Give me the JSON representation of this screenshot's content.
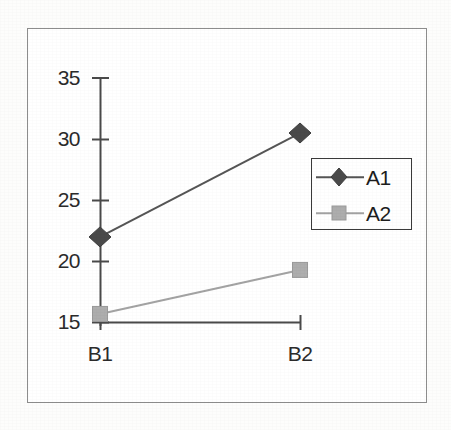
{
  "chart_data": {
    "type": "line",
    "title": "",
    "subtitle": "",
    "xlabel": "",
    "ylabel": "",
    "categories": [
      "B1",
      "B2"
    ],
    "series": [
      {
        "name": "A1",
        "values": [
          22.0,
          30.5
        ],
        "marker": "diamond",
        "color": "#4a4a4a"
      },
      {
        "name": "A2",
        "values": [
          15.7,
          19.3
        ],
        "marker": "square",
        "color": "#a3a3a3"
      }
    ],
    "ylim": [
      15,
      35
    ],
    "yticks": [
      15,
      20,
      25,
      30,
      35
    ],
    "ytick_labels": [
      "15",
      "20",
      "25",
      "30",
      "35"
    ],
    "xtick_labels": [
      "B1",
      "B2"
    ],
    "grid": false,
    "legend_position": "center-right",
    "legend_entries": [
      "A1",
      "A2"
    ],
    "annotations": []
  },
  "axes": {
    "y_ticks": [
      {
        "label": "35",
        "value": 35
      },
      {
        "label": "30",
        "value": 30
      },
      {
        "label": "25",
        "value": 25
      },
      {
        "label": "20",
        "value": 20
      },
      {
        "label": "15",
        "value": 15
      }
    ],
    "x_ticks": [
      {
        "label": "B1",
        "value": 0
      },
      {
        "label": "B2",
        "value": 1
      }
    ]
  },
  "legend": {
    "entries": [
      {
        "label": "A1",
        "marker": "diamond-marker-icon",
        "color": "#4a4a4a"
      },
      {
        "label": "A2",
        "marker": "square-marker-icon",
        "color": "#a3a3a3"
      }
    ]
  },
  "colors": {
    "series_a1": "#4a4a4a",
    "series_a2": "#a3a3a3",
    "axis": "#3a3a3a",
    "frame": "#8d8d8d",
    "text": "#2b2b2b",
    "background": "#ffffff"
  }
}
